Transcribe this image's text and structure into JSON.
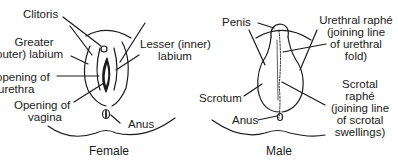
{
  "diagram": {
    "colors": {
      "ink": "#1a1a1a",
      "background": "#ffffff"
    },
    "female": {
      "caption": "Female",
      "labels": {
        "clitoris": "Clitoris",
        "greater_labium_1": "Greater",
        "greater_labium_2": "outer) labium",
        "lesser_labium_1": "Lesser (inner)",
        "lesser_labium_2": "labium",
        "urethra_opening_1": "opening of",
        "urethra_opening_2": "urethra",
        "vagina_opening_1": "Opening of",
        "vagina_opening_2": "vagina",
        "anus": "Anus"
      }
    },
    "male": {
      "caption": "Male",
      "labels": {
        "penis": "Penis",
        "urethral_raphe_1": "Urethral raphé",
        "urethral_raphe_2": "(joining line",
        "urethral_raphe_3": "of urethral",
        "urethral_raphe_4": "fold)",
        "scrotum": "Scrotum",
        "anus": "Anus",
        "scrotal_raphe_1": "Scrotal",
        "scrotal_raphe_2": "raphé",
        "scrotal_raphe_3": "(joining line",
        "scrotal_raphe_4": "of scrotal",
        "scrotal_raphe_5": "swellings)"
      }
    }
  }
}
